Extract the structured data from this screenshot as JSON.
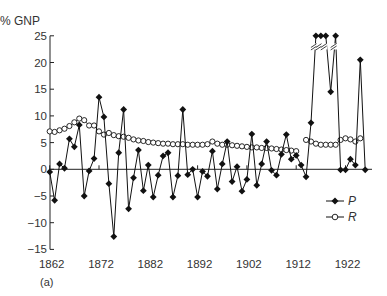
{
  "figure": {
    "panel_label": "(a)",
    "y_unit_label": "% GNP"
  },
  "chart_data": {
    "type": "line",
    "title": "",
    "xlabel": "",
    "ylabel": "% GNP",
    "xlim": [
      1862,
      1926
    ],
    "ylim": [
      -15,
      25
    ],
    "x_ticks": [
      1862,
      1872,
      1882,
      1892,
      1902,
      1912,
      1922
    ],
    "y_ticks": [
      -15,
      -10,
      -5,
      0,
      5,
      10,
      15,
      20,
      25
    ],
    "grid": false,
    "legend_position": "right, below zero line",
    "annotations": [
      "P values at 25 are clipped (break marks //) — actual values exceed 25"
    ],
    "x": [
      1862,
      1863,
      1864,
      1865,
      1866,
      1867,
      1868,
      1869,
      1870,
      1871,
      1872,
      1873,
      1874,
      1875,
      1876,
      1877,
      1878,
      1879,
      1880,
      1881,
      1882,
      1883,
      1884,
      1885,
      1886,
      1887,
      1888,
      1889,
      1890,
      1891,
      1892,
      1893,
      1894,
      1895,
      1896,
      1897,
      1898,
      1899,
      1900,
      1901,
      1902,
      1903,
      1904,
      1905,
      1906,
      1907,
      1908,
      1909,
      1910,
      1911,
      1912,
      1913,
      1914,
      1915,
      1916,
      1917,
      1918,
      1919,
      1920,
      1921,
      1922,
      1923,
      1924,
      1925,
      1926
    ],
    "series": [
      {
        "name": "P",
        "marker": "filled-diamond",
        "color": "#111111",
        "values": [
          -0.5,
          -5.8,
          1.0,
          0.2,
          5.7,
          4.2,
          8.3,
          -5.0,
          -0.3,
          2.0,
          13.5,
          9.8,
          -2.7,
          -12.6,
          3.1,
          11.2,
          -7.4,
          -1.6,
          3.6,
          -4.0,
          0.8,
          -5.2,
          -1.1,
          2.5,
          3.1,
          -5.2,
          -1.2,
          11.2,
          -1.0,
          0.0,
          -5.2,
          -0.4,
          -1.3,
          3.4,
          -3.7,
          1.0,
          5.2,
          -2.3,
          0.5,
          -4.1,
          -1.9,
          6.6,
          -3.0,
          1.0,
          5.2,
          -0.2,
          -1.1,
          2.8,
          6.5,
          1.9,
          2.6,
          0.8,
          -1.4,
          8.7,
          25,
          25,
          25,
          14.5,
          25,
          -0.1,
          -0.1,
          1.9,
          0.8,
          20.5,
          -0.1
        ],
        "clipped_at_25": [
          1916,
          1917,
          1918,
          1920
        ]
      },
      {
        "name": "R",
        "marker": "open-circle",
        "color": "#111111",
        "values": [
          7.1,
          7.0,
          7.3,
          7.6,
          8.1,
          8.8,
          9.5,
          9.2,
          8.2,
          8.2,
          7.1,
          6.5,
          6.8,
          6.4,
          6.2,
          6.1,
          5.9,
          5.6,
          5.4,
          5.3,
          5.1,
          5.0,
          4.9,
          4.8,
          4.8,
          4.7,
          4.7,
          4.7,
          4.6,
          4.6,
          4.6,
          4.6,
          4.7,
          5.2,
          4.8,
          4.6,
          4.6,
          4.5,
          4.4,
          4.3,
          4.2,
          4.1,
          4.1,
          4.0,
          4.0,
          3.9,
          3.8,
          3.7,
          3.6,
          3.5,
          3.4,
          null,
          5.5,
          5.2,
          4.8,
          4.6,
          4.6,
          4.6,
          4.6,
          5.5,
          5.8,
          5.6,
          5.2,
          5.8,
          null
        ]
      }
    ]
  }
}
